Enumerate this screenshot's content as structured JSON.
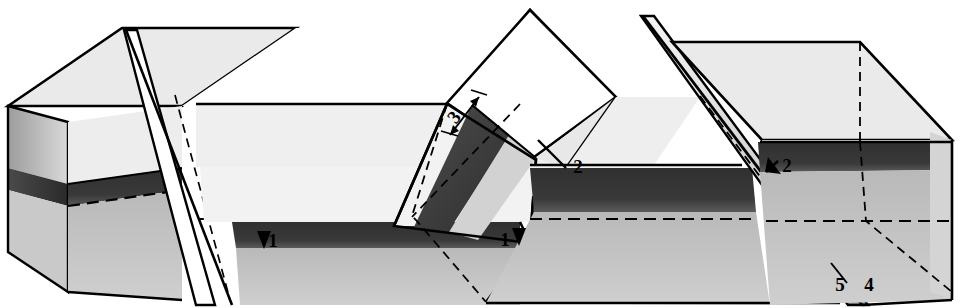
{
  "figure": {
    "kind": "geologic-block-diagram",
    "title": ""
  },
  "palette": {
    "outline": "#000000",
    "white": "#ffffff",
    "top_surface": "#e9e9e9",
    "upper_layer_light": "#f0f0f0",
    "marker_bed_dark": "#2b2b2b",
    "lower_layer_mid": "#c2c2c2",
    "side_shade": "#b9b9b9",
    "side_shade_dark": "#8d8d8d",
    "fault_face": "#d6d6d6",
    "background": "#ffffff"
  },
  "labels": [
    {
      "id": "l1a",
      "text": "1",
      "x": 273,
      "y": 247,
      "marker": "down-arrow-left",
      "note": "downthrown side indicator, left fault"
    },
    {
      "id": "l1b",
      "text": "1",
      "x": 505,
      "y": 246,
      "marker": "down-arrow-right",
      "note": "downthrown side indicator, central wedge"
    },
    {
      "id": "l2a",
      "text": "2",
      "x": 578,
      "y": 173,
      "marker": "tick-line",
      "note": "marker bed offset, central wedge"
    },
    {
      "id": "l2b",
      "text": "2",
      "x": 787,
      "y": 172,
      "marker": "up-arrow",
      "note": "upthrown side indicator, right fault"
    },
    {
      "id": "l3",
      "text": "3",
      "x": 459,
      "y": 121,
      "marker": "double-arrow",
      "note": "measured displacement across fault"
    },
    {
      "id": "l5",
      "text": "5",
      "x": 840,
      "y": 291,
      "marker": "none",
      "note": "fault trace on front face, left of intersection"
    },
    {
      "id": "l4",
      "text": "4",
      "x": 869,
      "y": 291,
      "marker": "none",
      "note": "block edge right of fault trace"
    }
  ],
  "legend_numbers": [
    "1",
    "2",
    "3",
    "4",
    "5"
  ],
  "strata": [
    {
      "name": "upper-unit",
      "tone": "light"
    },
    {
      "name": "marker-bed",
      "tone": "dark"
    },
    {
      "name": "lower-unit",
      "tone": "medium"
    }
  ]
}
